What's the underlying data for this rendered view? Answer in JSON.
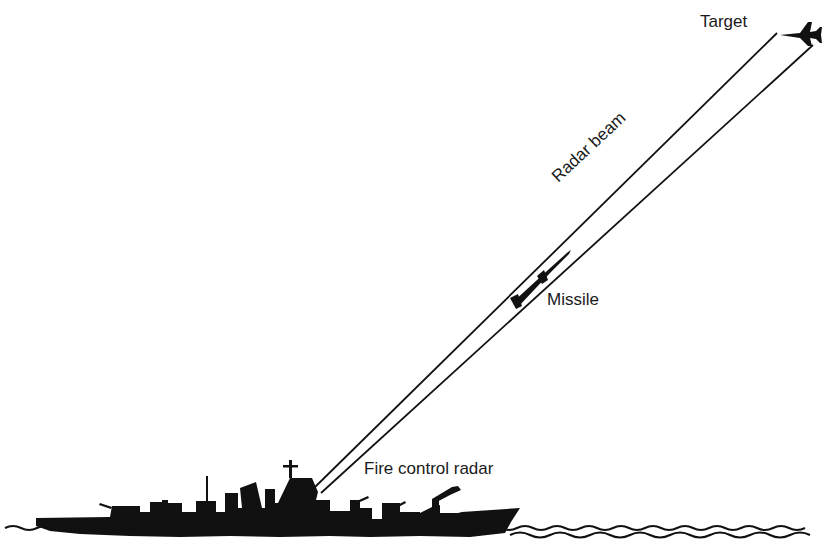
{
  "diagram": {
    "labels": {
      "target": "Target",
      "radar_beam": "Radar beam",
      "missile": "Missile",
      "fire_control_radar": "Fire control radar"
    },
    "colors": {
      "ink": "#111111",
      "background": "#ffffff"
    }
  }
}
